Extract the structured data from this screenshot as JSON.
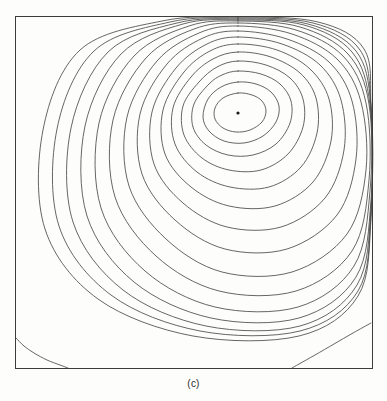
{
  "figure": {
    "caption": "(c)",
    "kind": "streamline-contour-plot",
    "background_color": "#fdfdfc",
    "line_color": "#4a4a4a",
    "frame_color": "#3c3c3c"
  },
  "chart_data": {
    "type": "line",
    "title": "(c)",
    "xlabel": "",
    "ylabel": "",
    "xlim": [
      0,
      1
    ],
    "ylim": [
      0,
      1
    ],
    "grid": false,
    "legend": "none",
    "plot_box": {
      "x": 15,
      "y": 16,
      "width": 357,
      "height": 352
    },
    "annotations": [
      {
        "name": "primary-vortex-center",
        "type": "point",
        "x": 0.624,
        "y": 0.724,
        "px": [
          238,
          113
        ]
      }
    ],
    "series": [
      {
        "name": "primary-vortex-contour-1-innermost",
        "closed": true,
        "points_px": [
          [
            238,
            93
          ],
          [
            252,
            95
          ],
          [
            262,
            101
          ],
          [
            266,
            111
          ],
          [
            262,
            122
          ],
          [
            250,
            130
          ],
          [
            236,
            132
          ],
          [
            223,
            128
          ],
          [
            215,
            119
          ],
          [
            215,
            108
          ],
          [
            223,
            98
          ],
          [
            238,
            93
          ]
        ]
      },
      {
        "name": "primary-vortex-contour-2",
        "closed": true,
        "points_px": [
          [
            238,
            82
          ],
          [
            256,
            84
          ],
          [
            271,
            92
          ],
          [
            279,
            106
          ],
          [
            276,
            122
          ],
          [
            263,
            136
          ],
          [
            244,
            143
          ],
          [
            224,
            141
          ],
          [
            209,
            131
          ],
          [
            203,
            117
          ],
          [
            208,
            99
          ],
          [
            221,
            87
          ],
          [
            238,
            82
          ]
        ]
      },
      {
        "name": "primary-vortex-contour-3",
        "closed": true,
        "points_px": [
          [
            238,
            71
          ],
          [
            261,
            74
          ],
          [
            280,
            84
          ],
          [
            291,
            101
          ],
          [
            290,
            123
          ],
          [
            276,
            144
          ],
          [
            253,
            155
          ],
          [
            228,
            155
          ],
          [
            206,
            145
          ],
          [
            193,
            127
          ],
          [
            194,
            104
          ],
          [
            209,
            84
          ],
          [
            222,
            75
          ],
          [
            238,
            71
          ]
        ]
      },
      {
        "name": "primary-vortex-contour-4",
        "closed": true,
        "points_px": [
          [
            238,
            61
          ],
          [
            266,
            65
          ],
          [
            290,
            78
          ],
          [
            303,
            99
          ],
          [
            303,
            127
          ],
          [
            288,
            154
          ],
          [
            261,
            170
          ],
          [
            229,
            170
          ],
          [
            202,
            158
          ],
          [
            184,
            135
          ],
          [
            183,
            106
          ],
          [
            199,
            82
          ],
          [
            217,
            67
          ],
          [
            238,
            61
          ]
        ]
      },
      {
        "name": "primary-vortex-contour-5",
        "closed": true,
        "points_px": [
          [
            238,
            52
          ],
          [
            271,
            57
          ],
          [
            300,
            73
          ],
          [
            316,
            98
          ],
          [
            317,
            133
          ],
          [
            301,
            167
          ],
          [
            269,
            187
          ],
          [
            230,
            187
          ],
          [
            197,
            172
          ],
          [
            175,
            144
          ],
          [
            173,
            108
          ],
          [
            191,
            77
          ],
          [
            213,
            59
          ],
          [
            238,
            52
          ]
        ]
      },
      {
        "name": "primary-vortex-contour-6",
        "closed": true,
        "points_px": [
          [
            238,
            44
          ],
          [
            277,
            50
          ],
          [
            310,
            69
          ],
          [
            329,
            99
          ],
          [
            331,
            141
          ],
          [
            313,
            182
          ],
          [
            275,
            206
          ],
          [
            229,
            206
          ],
          [
            191,
            187
          ],
          [
            165,
            154
          ],
          [
            163,
            110
          ],
          [
            184,
            72
          ],
          [
            210,
            51
          ],
          [
            238,
            44
          ]
        ]
      },
      {
        "name": "primary-vortex-contour-7",
        "closed": true,
        "points_px": [
          [
            238,
            37
          ],
          [
            282,
            44
          ],
          [
            320,
            65
          ],
          [
            341,
            100
          ],
          [
            344,
            150
          ],
          [
            325,
            198
          ],
          [
            281,
            227
          ],
          [
            227,
            227
          ],
          [
            183,
            203
          ],
          [
            154,
            164
          ],
          [
            152,
            112
          ],
          [
            176,
            68
          ],
          [
            207,
            44
          ],
          [
            238,
            37
          ]
        ]
      },
      {
        "name": "primary-vortex-contour-8",
        "closed": true,
        "points_px": [
          [
            238,
            31
          ],
          [
            287,
            39
          ],
          [
            329,
            62
          ],
          [
            352,
            101
          ],
          [
            356,
            159
          ],
          [
            337,
            215
          ],
          [
            287,
            249
          ],
          [
            225,
            249
          ],
          [
            175,
            220
          ],
          [
            142,
            174
          ],
          [
            140,
            114
          ],
          [
            167,
            64
          ],
          [
            203,
            38
          ],
          [
            238,
            31
          ]
        ]
      },
      {
        "name": "primary-vortex-contour-9",
        "closed": true,
        "points_px": [
          [
            238,
            26
          ],
          [
            292,
            34
          ],
          [
            337,
            59
          ],
          [
            361,
            102
          ],
          [
            366,
            170
          ],
          [
            347,
            234
          ],
          [
            292,
            272
          ],
          [
            222,
            272
          ],
          [
            166,
            239
          ],
          [
            129,
            186
          ],
          [
            127,
            117
          ],
          [
            157,
            61
          ],
          [
            199,
            33
          ],
          [
            238,
            26
          ]
        ]
      },
      {
        "name": "primary-vortex-contour-10",
        "closed": true,
        "points_px": [
          [
            238,
            23
          ],
          [
            296,
            30
          ],
          [
            343,
            56
          ],
          [
            366,
            103
          ],
          [
            369,
            180
          ],
          [
            352,
            251
          ],
          [
            296,
            291
          ],
          [
            219,
            291
          ],
          [
            156,
            256
          ],
          [
            115,
            197
          ],
          [
            113,
            120
          ],
          [
            146,
            58
          ],
          [
            194,
            29
          ],
          [
            238,
            23
          ]
        ]
      },
      {
        "name": "primary-vortex-contour-11",
        "closed": true,
        "points_px": [
          [
            238,
            21
          ],
          [
            300,
            27
          ],
          [
            348,
            54
          ],
          [
            369,
            104
          ],
          [
            370,
            191
          ],
          [
            354,
            266
          ],
          [
            298,
            307
          ],
          [
            215,
            307
          ],
          [
            145,
            271
          ],
          [
            101,
            208
          ],
          [
            99,
            123
          ],
          [
            134,
            56
          ],
          [
            189,
            26
          ],
          [
            238,
            21
          ]
        ]
      },
      {
        "name": "primary-vortex-contour-12",
        "closed": true,
        "points_px": [
          [
            238,
            20
          ],
          [
            304,
            25
          ],
          [
            352,
            52
          ],
          [
            370,
            105
          ],
          [
            371,
            200
          ],
          [
            356,
            277
          ],
          [
            299,
            318
          ],
          [
            211,
            318
          ],
          [
            134,
            282
          ],
          [
            87,
            216
          ],
          [
            85,
            126
          ],
          [
            121,
            54
          ],
          [
            183,
            24
          ],
          [
            238,
            20
          ]
        ]
      },
      {
        "name": "primary-vortex-contour-13",
        "closed": true,
        "points_px": [
          [
            238,
            19
          ],
          [
            308,
            24
          ],
          [
            356,
            51
          ],
          [
            371,
            106
          ],
          [
            371,
            208
          ],
          [
            357,
            285
          ],
          [
            300,
            326
          ],
          [
            206,
            326
          ],
          [
            123,
            290
          ],
          [
            73,
            222
          ],
          [
            71,
            128
          ],
          [
            108,
            52
          ],
          [
            177,
            23
          ],
          [
            238,
            19
          ]
        ]
      },
      {
        "name": "primary-vortex-contour-14",
        "closed": true,
        "points_px": [
          [
            238,
            18
          ],
          [
            313,
            23
          ],
          [
            360,
            50
          ],
          [
            371,
            107
          ],
          [
            371,
            214
          ],
          [
            358,
            291
          ],
          [
            300,
            331
          ],
          [
            200,
            331
          ],
          [
            111,
            295
          ],
          [
            59,
            226
          ],
          [
            57,
            129
          ],
          [
            94,
            51
          ],
          [
            170,
            22
          ],
          [
            238,
            18
          ]
        ]
      },
      {
        "name": "primary-vortex-contour-15-outermost",
        "closed": true,
        "points_px": [
          [
            238,
            17
          ],
          [
            318,
            22
          ],
          [
            364,
            49
          ],
          [
            371,
            108
          ],
          [
            371,
            219
          ],
          [
            358,
            296
          ],
          [
            299,
            336
          ],
          [
            193,
            336
          ],
          [
            98,
            299
          ],
          [
            45,
            229
          ],
          [
            43,
            130
          ],
          [
            80,
            50
          ],
          [
            162,
            21
          ],
          [
            238,
            17
          ]
        ]
      },
      {
        "name": "bottom-left-corner-eddy",
        "closed": false,
        "points_px": [
          [
            16,
            338
          ],
          [
            24,
            346
          ],
          [
            34,
            353
          ],
          [
            47,
            360
          ],
          [
            60,
            365
          ],
          [
            68,
            368
          ]
        ]
      },
      {
        "name": "bottom-right-corner-eddy",
        "closed": false,
        "points_px": [
          [
            371,
            323
          ],
          [
            353,
            333
          ],
          [
            334,
            344
          ],
          [
            315,
            355
          ],
          [
            299,
            364
          ],
          [
            292,
            368
          ]
        ]
      }
    ]
  }
}
